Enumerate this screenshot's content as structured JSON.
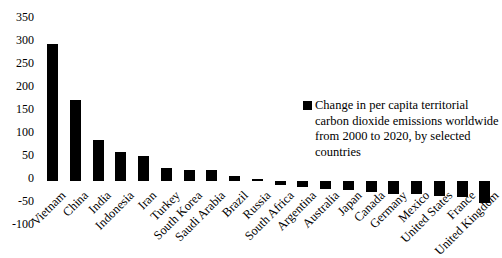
{
  "chart_data": {
    "type": "bar",
    "title": "",
    "legend_label": "Change in per capita territorial carbon dioxide emissions worldwide from 2000 to 2020, by selected countries",
    "categories": [
      "Vietnam",
      "China",
      "India",
      "Indonesia",
      "Iran",
      "Turkey",
      "South Korea",
      "Saudi Arabia",
      "Brazil",
      "Russia",
      "South Africa",
      "Argentina",
      "Australia",
      "Japan",
      "Canada",
      "Germany",
      "Mexico",
      "United States",
      "France",
      "United Kingdom"
    ],
    "values": [
      297,
      177,
      90,
      63,
      55,
      28,
      24,
      23,
      11,
      5,
      -8,
      -13,
      -17,
      -20,
      -24,
      -28,
      -29,
      -33,
      -35,
      -47
    ],
    "xlabel": "",
    "ylabel": "",
    "ylim": [
      -100,
      350
    ],
    "yticks": [
      350,
      300,
      250,
      200,
      150,
      100,
      50,
      0,
      -50,
      -100
    ],
    "bar_color": "#000000",
    "text_color": "#000000",
    "background_color": "#ffffff",
    "grid": false,
    "legend_position": "middle-right",
    "legend_marker": "black-square"
  }
}
